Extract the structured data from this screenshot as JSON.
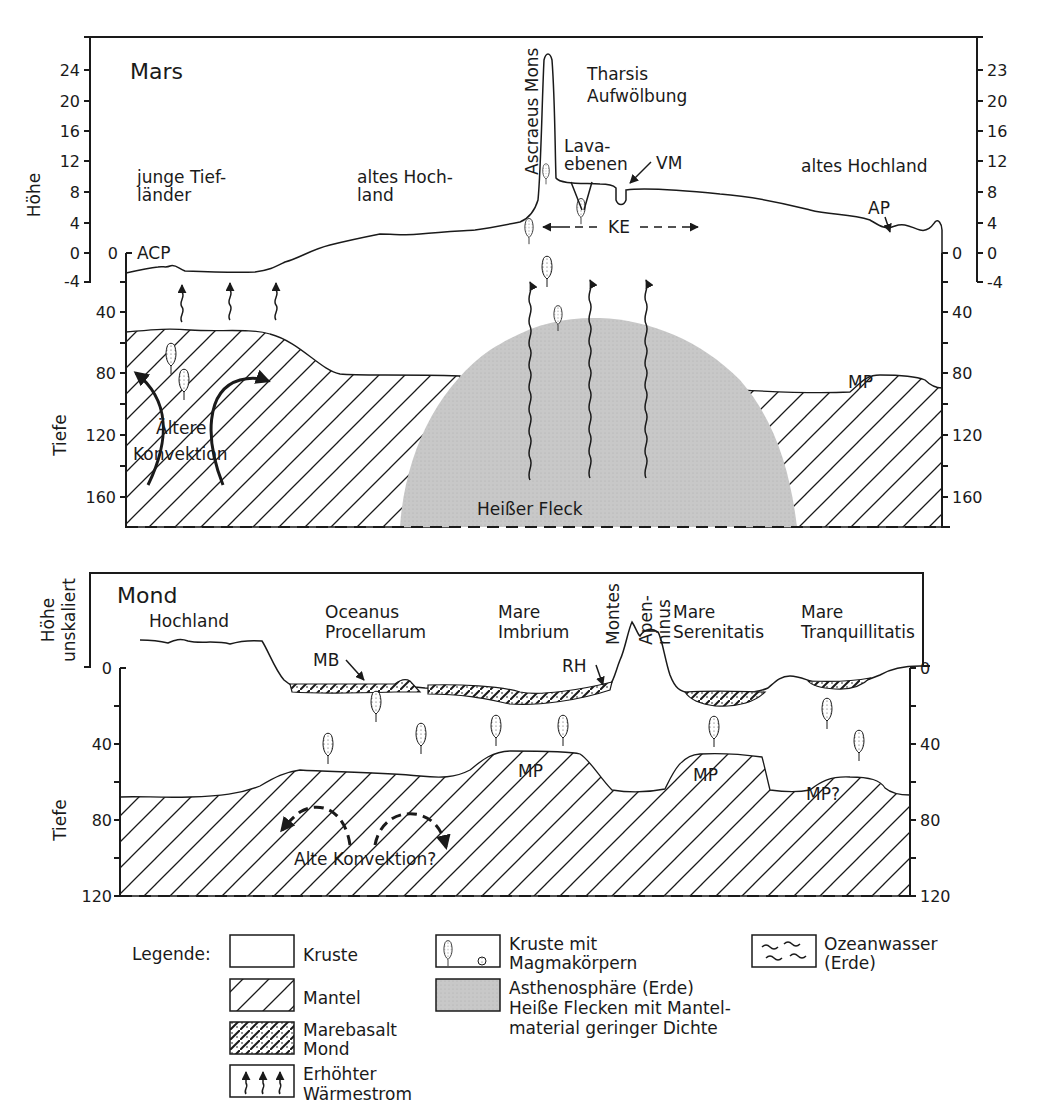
{
  "mars": {
    "title": "Mars",
    "y_label_top": "Höhe",
    "y_label_bottom": "Tiefe",
    "height_ticks_left": [
      "24",
      "20",
      "16",
      "12",
      "8",
      "4",
      "0",
      "-4"
    ],
    "height_ticks_right": [
      "23",
      "20",
      "16",
      "12",
      "8",
      "4",
      "0",
      "-4"
    ],
    "inner_zero_left": "0",
    "inner_zero_right": "0",
    "depth_ticks": [
      "40",
      "80",
      "120",
      "160"
    ],
    "regions": {
      "young_lowlands": [
        "junge Tief-",
        "länder"
      ],
      "old_highland_mid": [
        "altes Hoch-",
        "land"
      ],
      "ascraeus": "Ascraeus Mons",
      "tharsis": [
        "Tharsis",
        "Aufwölbung"
      ],
      "lava": [
        "Lava-",
        "ebenen"
      ],
      "old_highland_right": "altes Hochland",
      "hot_spot": "Heißer Fleck",
      "convection": [
        "Ältere",
        "Konvektion"
      ]
    },
    "abbreviations": {
      "acp": "ACP",
      "vm": "VM",
      "ke": "KE",
      "ap": "AP",
      "mp": "MP"
    }
  },
  "moon": {
    "title": "Mond",
    "y_label_top": [
      "Höhe",
      "unskaliert"
    ],
    "y_label_bottom": "Tiefe",
    "left_ticks": [
      "0",
      "40",
      "80",
      "120"
    ],
    "right_ticks": [
      "0",
      "40",
      "80",
      "120"
    ],
    "regions": {
      "highland": "Hochland",
      "procellarum": [
        "Oceanus",
        "Procellarum"
      ],
      "imbrium": [
        "Mare",
        "Imbrium"
      ],
      "montes": "Montes",
      "apenninus": [
        "Apen-",
        "ninus"
      ],
      "serenitatis": [
        "Mare",
        "Serenitatis"
      ],
      "tranquillitatis": [
        "Mare",
        "Tranquillitatis"
      ],
      "convection": "Alte Konvektion?"
    },
    "abbreviations": {
      "mb": "MB",
      "rh": "RH",
      "mp1": "MP",
      "mp2": "MP",
      "mp3": "MP?"
    }
  },
  "legend": {
    "title": "Legende:",
    "items": [
      {
        "key": "kruste",
        "label": [
          "Kruste"
        ]
      },
      {
        "key": "mantel",
        "label": [
          "Mantel"
        ]
      },
      {
        "key": "marebasalt",
        "label": [
          "Marebasalt",
          "Mond"
        ]
      },
      {
        "key": "waermestrom",
        "label": [
          "Erhöhter",
          "Wärmestrom"
        ]
      },
      {
        "key": "magma",
        "label": [
          "Kruste mit",
          "Magmakörpern"
        ]
      },
      {
        "key": "asthenosphaere",
        "label": [
          "Asthenosphäre (Erde)",
          "Heiße Flecken mit Mantel-",
          "material geringer Dichte"
        ]
      },
      {
        "key": "ozean",
        "label": [
          "Ozeanwasser",
          "(Erde)"
        ]
      }
    ]
  },
  "colors": {
    "ink": "#1a1a1a",
    "hot_spot_fill": "#c8c8c8",
    "background": "#ffffff"
  }
}
